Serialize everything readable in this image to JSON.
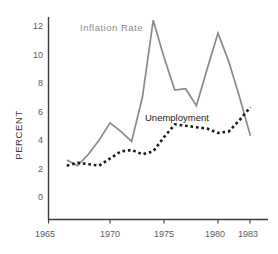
{
  "chart_data": {
    "type": "line",
    "title": "",
    "subtitle": "",
    "xlabel": "",
    "ylabel": "PERCENT",
    "xlim": [
      1965.2,
      1983.6
    ],
    "ylim": [
      0,
      13.0
    ],
    "grid": false,
    "legend_position": "inline-annotations",
    "xticks": [
      1965,
      1970,
      1975,
      1980,
      1983
    ],
    "xtick_labels": [
      "1965",
      "1970",
      "1975",
      "1980",
      "1983"
    ],
    "yticks": [
      0,
      2,
      4,
      6,
      8,
      10,
      12
    ],
    "ytick_labels": [
      "0",
      "2",
      "4",
      "6",
      "8",
      "10",
      "12"
    ],
    "x": [
      1966,
      1967,
      1968,
      1969,
      1970,
      1971,
      1972,
      1973,
      1974,
      1975,
      1976,
      1977,
      1978,
      1979,
      1980,
      1981,
      1982,
      1983
    ],
    "series": [
      {
        "name": "Inflation Rate",
        "style": "solid",
        "color": "#8a8a8a",
        "values": [
          2.6,
          2.2,
          3.0,
          4.0,
          5.2,
          4.6,
          3.9,
          7.0,
          12.4,
          9.8,
          7.5,
          7.6,
          6.4,
          9.0,
          11.5,
          9.5,
          7.0,
          4.3
        ]
      },
      {
        "name": "Unemployment",
        "style": "dotted",
        "color": "#1a1a1a",
        "values": [
          2.2,
          2.4,
          2.3,
          2.2,
          2.7,
          3.2,
          3.3,
          3.0,
          3.2,
          4.2,
          5.1,
          5.0,
          4.9,
          4.8,
          4.5,
          4.6,
          5.4,
          6.3
        ]
      }
    ],
    "annotations": [
      {
        "text": "Inflation Rate",
        "series": "Inflation Rate",
        "x": 1968.6,
        "y": 12.6
      },
      {
        "text": "Unemployment",
        "series": "Unemployment",
        "x": 1974.3,
        "y": 6.3
      }
    ]
  },
  "axis": {
    "ylabel": "PERCENT"
  },
  "yticks": {
    "t0": "0",
    "t1": "2",
    "t2": "4",
    "t3": "6",
    "t4": "8",
    "t5": "10",
    "t6": "12"
  },
  "xticks": {
    "t0": "1965",
    "t1": "1970",
    "t2": "1975",
    "t3": "1980",
    "t4": "1983"
  },
  "labels": {
    "inflation": "Inflation Rate",
    "unemployment": "Unemployment"
  }
}
